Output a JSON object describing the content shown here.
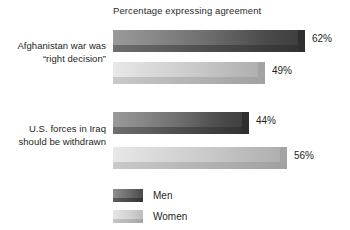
{
  "chart_data": {
    "type": "bar",
    "orientation": "horizontal",
    "title": "Percentage expressing agreement",
    "xlabel": "",
    "ylabel": "",
    "xlim": [
      0,
      100
    ],
    "grid": false,
    "legend_position": "bottom-left",
    "categories": [
      "Afghanistan war was “right decision”",
      "U.S. forces in Iraq should be withdrawn"
    ],
    "series": [
      {
        "name": "Men",
        "values": [
          62,
          44
        ],
        "color": "#4a4a4a"
      },
      {
        "name": "Women",
        "values": [
          49,
          56
        ],
        "color": "#cccccc"
      }
    ],
    "data_labels": [
      "62%",
      "49%",
      "44%",
      "56%"
    ]
  },
  "title": {
    "text": "Percentage expressing agreement"
  },
  "categories": [
    {
      "line1": "Afghanistan war was",
      "line2": "“right decision”"
    },
    {
      "line1": "U.S. forces in Iraq",
      "line2": "should be withdrawn"
    }
  ],
  "bars": [
    {
      "series": "Men",
      "category": 0,
      "value": 62,
      "label": "62%"
    },
    {
      "series": "Women",
      "category": 0,
      "value": 49,
      "label": "49%"
    },
    {
      "series": "Men",
      "category": 1,
      "value": 44,
      "label": "44%"
    },
    {
      "series": "Women",
      "category": 1,
      "value": 56,
      "label": "56%"
    }
  ],
  "legend": {
    "items": [
      {
        "label": "Men",
        "color": "#4a4a4a"
      },
      {
        "label": "Women",
        "color": "#cccccc"
      }
    ]
  }
}
